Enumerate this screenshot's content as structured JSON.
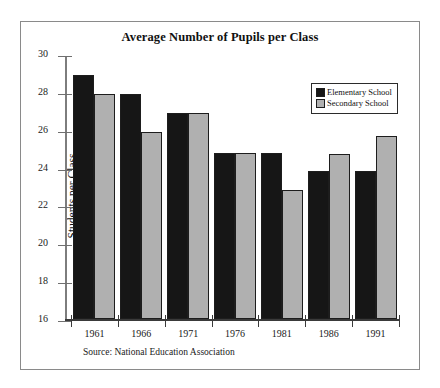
{
  "chart_data": {
    "type": "bar",
    "title": "Average Number of Pupils per Class",
    "xlabel": "",
    "ylabel": "Students per Class",
    "ylim": [
      16,
      30
    ],
    "yticks": [
      16,
      18,
      20,
      22,
      24,
      26,
      28,
      30
    ],
    "grid": false,
    "legend_position": "top-right",
    "categories": [
      "1961",
      "1966",
      "1971",
      "1976",
      "1981",
      "1986",
      "1991"
    ],
    "series": [
      {
        "name": "Elementary School",
        "color": "#161616",
        "values": [
          29,
          28,
          27,
          24.9,
          24.9,
          23.9,
          23.9
        ]
      },
      {
        "name": "Secondary School",
        "color": "#b0b0b0",
        "values": [
          28,
          26,
          27,
          24.9,
          22.9,
          24.8,
          25.8
        ]
      }
    ],
    "annotations": [
      "Source: National Education Association"
    ]
  },
  "figure": {
    "source_note": "Source: National Education Association"
  }
}
